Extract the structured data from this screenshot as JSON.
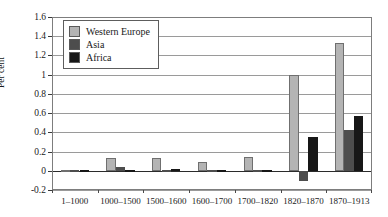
{
  "chart_data": {
    "type": "bar",
    "title": "",
    "xlabel": "",
    "ylabel": "Per cent",
    "ylim": [
      -0.2,
      1.6
    ],
    "ytick_step": 0.2,
    "yticks": [
      "1.6",
      "1.4",
      "1.2",
      "1",
      "0.8",
      "0.6",
      "0.4",
      "0.2",
      "0",
      "-0.2"
    ],
    "ytick_values": [
      1.6,
      1.4,
      1.2,
      1.0,
      0.8,
      0.6,
      0.4,
      0.2,
      0,
      -0.2
    ],
    "grid": true,
    "legend_position": "top-left",
    "categories": [
      "1–1000",
      "1000–1500",
      "1500–1600",
      "1600–1700",
      "1700–1820",
      "1820–1870",
      "1870–1913"
    ],
    "series": [
      {
        "name": "Western Europe",
        "color": "#b4b4b4",
        "values": [
          0.0,
          0.13,
          0.13,
          0.09,
          0.14,
          1.0,
          1.33
        ]
      },
      {
        "name": "Asia",
        "color": "#4d4d4d",
        "values": [
          0.0,
          0.04,
          0.0,
          0.0,
          0.0,
          -0.11,
          0.42
        ]
      },
      {
        "name": "Africa",
        "color": "#171717",
        "values": [
          0.0,
          0.01,
          0.02,
          0.0,
          0.01,
          0.35,
          0.57
        ]
      }
    ]
  },
  "legend": {
    "items": [
      {
        "label": "Western Europe",
        "color": "#b4b4b4"
      },
      {
        "label": "Asia",
        "color": "#4d4d4d"
      },
      {
        "label": "Africa",
        "color": "#171717"
      }
    ]
  },
  "axis": {
    "y_title": "Per cent"
  }
}
